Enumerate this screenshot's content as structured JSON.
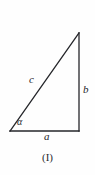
{
  "figure": {
    "type": "right-triangle-diagram",
    "caption": "(I)",
    "background_color": "#fefefe",
    "stroke_color": "#25262a",
    "labels": {
      "hypotenuse": "c",
      "vertical_leg": "b",
      "horizontal_leg": "a",
      "angle": "α"
    },
    "geometry": {
      "vertex_bottom_left": [
        10,
        131
      ],
      "vertex_bottom_right": [
        79,
        131
      ],
      "vertex_top_right": [
        79,
        33
      ],
      "angle_arc_radius": 14,
      "stroke_width": 1.3
    }
  }
}
